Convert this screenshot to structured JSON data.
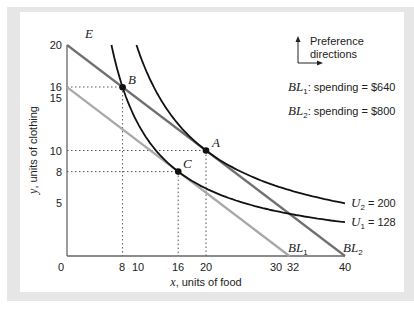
{
  "chart_data": {
    "type": "line",
    "title": "",
    "xlabel": "x, units of food",
    "ylabel": "y, units of clothing",
    "xlim": [
      0,
      40
    ],
    "ylim": [
      0,
      20
    ],
    "grid": false,
    "x_ticks": [
      0,
      8,
      10,
      16,
      20,
      30,
      32,
      40
    ],
    "y_ticks": [
      5,
      8,
      10,
      15,
      16,
      20
    ],
    "series": [
      {
        "name": "BL1",
        "kind": "budget_line",
        "points": [
          [
            0,
            16
          ],
          [
            32,
            0
          ]
        ],
        "label": "BL1",
        "color": "#a8a8a8",
        "spending": "$640"
      },
      {
        "name": "BL2",
        "kind": "budget_line",
        "points": [
          [
            0,
            20
          ],
          [
            40,
            0
          ]
        ],
        "label": "BL2",
        "color": "#707070",
        "spending": "$800"
      },
      {
        "name": "U1 = 128",
        "kind": "indifference_curve",
        "equation": "x*y = 128",
        "color": "#111111"
      },
      {
        "name": "U2 = 200",
        "kind": "indifference_curve",
        "equation": "x*y = 200",
        "color": "#111111"
      }
    ],
    "points": [
      {
        "label": "A",
        "x": 20,
        "y": 10
      },
      {
        "label": "B",
        "x": 8,
        "y": 16
      },
      {
        "label": "C",
        "x": 16,
        "y": 8
      },
      {
        "label": "E",
        "x": 0,
        "y": 20
      }
    ],
    "legend": {
      "bl1": "BL1: spending = $640",
      "bl2": "BL2: spending = $800",
      "u1": "U1 = 128",
      "u2": "U2 = 200"
    },
    "annotations": [
      "Preference directions"
    ]
  },
  "labels": {
    "E": "E",
    "A": "A",
    "B": "B",
    "C": "C",
    "pref1": "Preference",
    "pref2": "directions",
    "bl1_text": ": spending = $640",
    "bl2_text": ": spending = $800",
    "bl_prefix": "BL",
    "sub1": "1",
    "sub2": "2",
    "u_prefix": "U",
    "u1_val": " = 128",
    "u2_val": " = 200",
    "xlabel_var": "x",
    "xlabel_rest": ", units of food",
    "ylabel_var": "y",
    "ylabel_rest": ", units of clothing"
  },
  "ticks": {
    "x": [
      "0",
      "8",
      "10",
      "16",
      "20",
      "30",
      "32",
      "40"
    ],
    "y": [
      "20",
      "16",
      "15",
      "10",
      "8",
      "5"
    ]
  }
}
